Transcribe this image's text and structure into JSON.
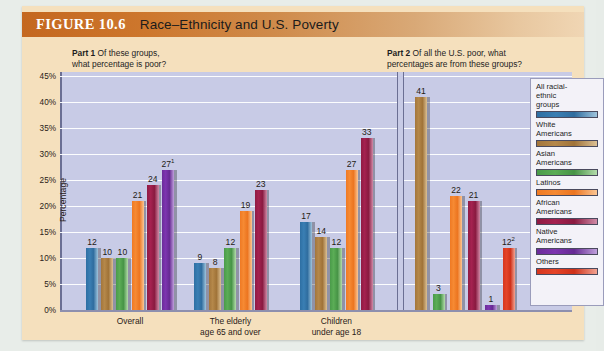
{
  "header": {
    "figure_label": "FIGURE 10.6",
    "title": "Race–Ethnicity and U.S. Poverty"
  },
  "part1": {
    "prefix": "Part 1",
    "text_line1": "Of these groups,",
    "text_line2": "what percentage is poor?"
  },
  "part2": {
    "prefix": "Part 2",
    "text_line1": "Of all the U.S. poor, what",
    "text_line2": "percentages are from these groups?"
  },
  "axis": {
    "ylabel": "Percentage",
    "ticks": [
      "45%",
      "40%",
      "35%",
      "30%",
      "25%",
      "20%",
      "15%",
      "10%",
      "5%",
      "0%"
    ]
  },
  "legend": {
    "items": [
      {
        "label": "All racial-\nethnic\ngroups",
        "color": "#2f6d9f"
      },
      {
        "label": "White\nAmericans",
        "color": "#a3763c"
      },
      {
        "label": "Asian\nAmericans",
        "color": "#4a9b4a"
      },
      {
        "label": "Latinos",
        "color": "#ef7a24"
      },
      {
        "label": "African\nAmericans",
        "color": "#8f1b43"
      },
      {
        "label": "Native\nAmericans",
        "color": "#6b2c9a"
      },
      {
        "label": "Others",
        "color": "#d6361f"
      }
    ]
  },
  "chart_data": {
    "type": "bar",
    "title": "Race–Ethnicity and U.S. Poverty",
    "ylabel": "Percentage",
    "xlabel": "",
    "ylim": [
      0,
      45
    ],
    "grid": true,
    "legend_position": "right",
    "panels": [
      {
        "name": "Part 1",
        "question": "Of these groups, what percentage is poor?",
        "categories": [
          "Overall",
          "The elderly\nage 65 and over",
          "Children\nunder age 18"
        ],
        "series": [
          {
            "name": "All racial-ethnic groups",
            "color": "#2f6d9f",
            "values": [
              12,
              9,
              17
            ]
          },
          {
            "name": "White Americans",
            "color": "#a3763c",
            "values": [
              10,
              8,
              14
            ]
          },
          {
            "name": "Asian Americans",
            "color": "#4a9b4a",
            "values": [
              10,
              12,
              12
            ]
          },
          {
            "name": "Latinos",
            "color": "#ef7a24",
            "values": [
              21,
              19,
              27
            ]
          },
          {
            "name": "African Americans",
            "color": "#8f1b43",
            "values": [
              24,
              23,
              33
            ]
          },
          {
            "name": "Native Americans",
            "color": "#6b2c9a",
            "values": [
              27,
              null,
              null
            ]
          }
        ],
        "labels": [
          [
            "12",
            "10",
            "10",
            "21",
            "24",
            "27¹"
          ],
          [
            "9",
            "8",
            "12",
            "19",
            "23"
          ],
          [
            "17",
            "14",
            "12",
            "27",
            "33"
          ]
        ]
      },
      {
        "name": "Part 2",
        "question": "Of all the U.S. poor, what percentages are from these groups?",
        "categories": [
          ""
        ],
        "series": [
          {
            "name": "White Americans",
            "color": "#a3763c",
            "value": 41,
            "label": "41"
          },
          {
            "name": "Asian Americans",
            "color": "#4a9b4a",
            "value": 3,
            "label": "3"
          },
          {
            "name": "Latinos",
            "color": "#ef7a24",
            "value": 22,
            "label": "22"
          },
          {
            "name": "African Americans",
            "color": "#8f1b43",
            "value": 21,
            "label": "21"
          },
          {
            "name": "Native Americans",
            "color": "#6b2c9a",
            "value": 1,
            "label": "1"
          },
          {
            "name": "Others",
            "color": "#d6361f",
            "value": 12,
            "label": "12²"
          }
        ]
      }
    ]
  }
}
